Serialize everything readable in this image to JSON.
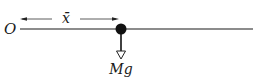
{
  "diagram": {
    "origin_label": "O",
    "distance_label": "x̄",
    "force_label": "Mg",
    "colors": {
      "rod": "#555555",
      "ink": "#111111",
      "background": "#ffffff"
    }
  }
}
